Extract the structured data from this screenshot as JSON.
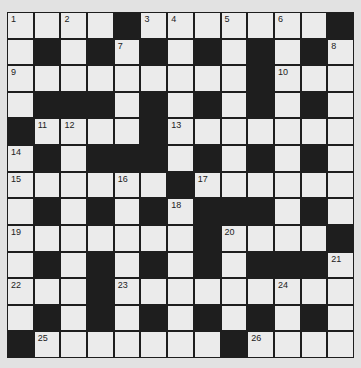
{
  "puzzle": {
    "rows": 13,
    "cols": 13,
    "colors": {
      "black": "#1e1e1e",
      "white": "#ebebeb",
      "background": "#e2e2e2"
    },
    "layout": [
      "....#.......#",
      ".#.#.#.#.#.#.",
      ".........#...",
      ".###.#.#.#.#.",
      "#....#.......",
      ".#.###.#.#.#.",
      "......#......",
      ".#.#.#.###.#.",
      ".......#....#",
      ".#.#.#.#.###.",
      "...#.........",
      ".#.#.#.#.#.#.",
      "#.......#...."
    ],
    "numbers": [
      {
        "r": 0,
        "c": 0,
        "n": "1"
      },
      {
        "r": 0,
        "c": 2,
        "n": "2"
      },
      {
        "r": 0,
        "c": 5,
        "n": "3"
      },
      {
        "r": 0,
        "c": 6,
        "n": "4"
      },
      {
        "r": 0,
        "c": 8,
        "n": "5"
      },
      {
        "r": 0,
        "c": 10,
        "n": "6"
      },
      {
        "r": 1,
        "c": 4,
        "n": "7"
      },
      {
        "r": 1,
        "c": 12,
        "n": "8"
      },
      {
        "r": 2,
        "c": 0,
        "n": "9"
      },
      {
        "r": 2,
        "c": 10,
        "n": "10"
      },
      {
        "r": 4,
        "c": 1,
        "n": "11"
      },
      {
        "r": 4,
        "c": 2,
        "n": "12"
      },
      {
        "r": 4,
        "c": 6,
        "n": "13"
      },
      {
        "r": 5,
        "c": 0,
        "n": "14"
      },
      {
        "r": 6,
        "c": 0,
        "n": "15"
      },
      {
        "r": 6,
        "c": 4,
        "n": "16"
      },
      {
        "r": 6,
        "c": 7,
        "n": "17"
      },
      {
        "r": 7,
        "c": 6,
        "n": "18"
      },
      {
        "r": 8,
        "c": 0,
        "n": "19"
      },
      {
        "r": 8,
        "c": 8,
        "n": "20"
      },
      {
        "r": 9,
        "c": 12,
        "n": "21"
      },
      {
        "r": 10,
        "c": 0,
        "n": "22"
      },
      {
        "r": 10,
        "c": 4,
        "n": "23"
      },
      {
        "r": 10,
        "c": 10,
        "n": "24"
      },
      {
        "r": 12,
        "c": 1,
        "n": "25"
      },
      {
        "r": 12,
        "c": 9,
        "n": "26"
      }
    ]
  }
}
